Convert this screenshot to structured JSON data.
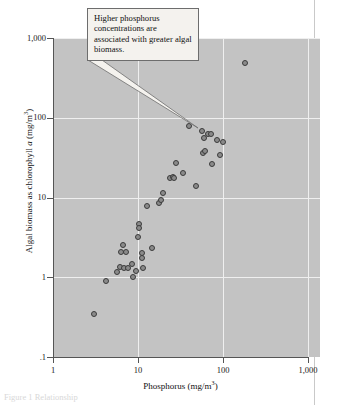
{
  "figure": {
    "callout_text": "Higher phosphorus concentrations are associated with greater algal biomass.",
    "caption_fragment": "Figure 1 Relationship"
  },
  "chart_data": {
    "type": "scatter",
    "title": "",
    "xlabel_text": "Phosphorus (mg/m",
    "xlabel_sup": "3",
    "xlabel_tail": ")",
    "ylabel_lead": "Algal biomass as chlorophyll ",
    "ylabel_ital": "a",
    "ylabel_tail": " (mg/m",
    "ylabel_sup": "3",
    "ylabel_end": ")",
    "xscale": "log",
    "yscale": "log",
    "xlim": [
      1,
      1000
    ],
    "ylim": [
      0.1,
      1000
    ],
    "xticks": [
      1,
      10,
      100,
      1000
    ],
    "xticklabels": [
      "1",
      "10",
      "100",
      "1,000"
    ],
    "yticks": [
      0.1,
      1,
      10,
      100,
      1000
    ],
    "yticklabels": [
      ".1",
      "1",
      "10",
      "100",
      "1,000"
    ],
    "grid": true,
    "grid_color": "#efefef",
    "plot_bg": "#c3c3c3",
    "marker_fill": "#8a8a8a",
    "marker_edge": "#3b3b3b",
    "annotation_target": {
      "x": 40,
      "y": 78
    },
    "points": [
      {
        "x": 3.0,
        "y": 0.35
      },
      {
        "x": 4.2,
        "y": 0.9
      },
      {
        "x": 5.6,
        "y": 1.15
      },
      {
        "x": 6.2,
        "y": 1.35
      },
      {
        "x": 6.3,
        "y": 2.1
      },
      {
        "x": 6.6,
        "y": 2.55
      },
      {
        "x": 6.8,
        "y": 1.3
      },
      {
        "x": 7.2,
        "y": 2.1
      },
      {
        "x": 7.6,
        "y": 1.3
      },
      {
        "x": 8.6,
        "y": 1.45
      },
      {
        "x": 8.8,
        "y": 1.0
      },
      {
        "x": 9.6,
        "y": 1.2
      },
      {
        "x": 10.0,
        "y": 3.2
      },
      {
        "x": 10.2,
        "y": 4.6
      },
      {
        "x": 10.4,
        "y": 4.2
      },
      {
        "x": 11.0,
        "y": 2.0
      },
      {
        "x": 11.2,
        "y": 1.75
      },
      {
        "x": 11.4,
        "y": 1.3
      },
      {
        "x": 12.8,
        "y": 7.8
      },
      {
        "x": 14.5,
        "y": 2.3
      },
      {
        "x": 17.5,
        "y": 8.6
      },
      {
        "x": 18.5,
        "y": 9.2
      },
      {
        "x": 19.5,
        "y": 11.5
      },
      {
        "x": 24.0,
        "y": 17.5
      },
      {
        "x": 25.5,
        "y": 18.0
      },
      {
        "x": 26.5,
        "y": 17.5
      },
      {
        "x": 28.0,
        "y": 27.0
      },
      {
        "x": 34.0,
        "y": 20.5
      },
      {
        "x": 40.0,
        "y": 78.0
      },
      {
        "x": 48.0,
        "y": 14.0
      },
      {
        "x": 56.0,
        "y": 68.0
      },
      {
        "x": 58.0,
        "y": 36.0
      },
      {
        "x": 60.0,
        "y": 55.0
      },
      {
        "x": 62.0,
        "y": 38.0
      },
      {
        "x": 66.0,
        "y": 62.0
      },
      {
        "x": 72.0,
        "y": 62.0
      },
      {
        "x": 74.0,
        "y": 26.0
      },
      {
        "x": 86.0,
        "y": 53.0
      },
      {
        "x": 92.0,
        "y": 34.0
      },
      {
        "x": 100.0,
        "y": 50.0
      },
      {
        "x": 180.0,
        "y": 490.0
      }
    ]
  }
}
